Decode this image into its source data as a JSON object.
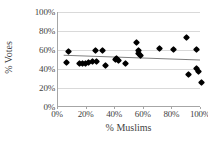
{
  "chart_data": {
    "type": "scatter",
    "title": "",
    "xlabel": "% Muslims",
    "ylabel": "% Votes",
    "xlim": [
      0,
      100
    ],
    "ylim": [
      0,
      100
    ],
    "xticks": [
      "0%",
      "20%",
      "40%",
      "60%",
      "80%",
      "100%"
    ],
    "xtick_values": [
      0,
      20,
      40,
      60,
      80,
      100
    ],
    "yticks": [
      "0%",
      "20%",
      "40%",
      "60%",
      "80%",
      "100%"
    ],
    "ytick_values": [
      0,
      20,
      40,
      60,
      80,
      100
    ],
    "grid": "horizontal",
    "legend": "none",
    "marker": "black-diamond",
    "marker_color": "#000000",
    "gridline_color": "#d9d9d9",
    "axis_color": "#a6a6a6",
    "trendline": {
      "color": "#808080",
      "x0": 4,
      "y0": 54,
      "x1": 100,
      "y1": 49
    },
    "points": [
      {
        "x": 6,
        "y": 47
      },
      {
        "x": 7,
        "y": 58
      },
      {
        "x": 15,
        "y": 46
      },
      {
        "x": 17,
        "y": 46
      },
      {
        "x": 19,
        "y": 46
      },
      {
        "x": 21,
        "y": 47
      },
      {
        "x": 24,
        "y": 48
      },
      {
        "x": 26,
        "y": 60
      },
      {
        "x": 27,
        "y": 48
      },
      {
        "x": 31,
        "y": 59
      },
      {
        "x": 33,
        "y": 44
      },
      {
        "x": 40,
        "y": 50
      },
      {
        "x": 41,
        "y": 51
      },
      {
        "x": 42,
        "y": 49
      },
      {
        "x": 47,
        "y": 46
      },
      {
        "x": 55,
        "y": 68
      },
      {
        "x": 56,
        "y": 60
      },
      {
        "x": 56,
        "y": 56
      },
      {
        "x": 58,
        "y": 54
      },
      {
        "x": 71,
        "y": 62
      },
      {
        "x": 81,
        "y": 61
      },
      {
        "x": 90,
        "y": 73
      },
      {
        "x": 91,
        "y": 34
      },
      {
        "x": 97,
        "y": 61
      },
      {
        "x": 97,
        "y": 41
      },
      {
        "x": 98,
        "y": 37
      },
      {
        "x": 100,
        "y": 26
      }
    ]
  },
  "axes": {
    "x_title": "% Muslims",
    "y_title": "% Votes"
  }
}
